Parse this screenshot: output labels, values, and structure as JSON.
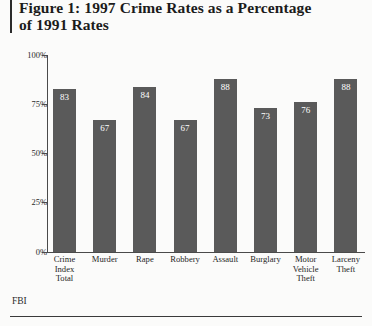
{
  "figure": {
    "title_line1": "Figure 1: 1997 Crime Rates as a Percentage",
    "title_line2": "of 1991 Rates",
    "source_note": "FBI"
  },
  "chart_data": {
    "type": "bar",
    "title": "Figure 1: 1997 Crime Rates as a Percentage of 1991 Rates",
    "xlabel": "",
    "ylabel": "",
    "ylim": [
      0,
      100
    ],
    "ytick_labels": [
      "100%",
      "75%",
      "50%",
      "25%",
      "0%"
    ],
    "ytick_values": [
      100,
      75,
      50,
      25,
      0
    ],
    "grid": false,
    "legend": false,
    "bar_color": "#5a5a5a",
    "value_label_color": "#ffffff",
    "categories": [
      "Crime Index Total",
      "Murder",
      "Rape",
      "Robbery",
      "Assault",
      "Burglary",
      "Motor Vehicle Theft",
      "Larceny Theft"
    ],
    "category_lines": [
      [
        "Crime",
        "Index",
        "Total"
      ],
      [
        "Murder"
      ],
      [
        "Rape"
      ],
      [
        "Robbery"
      ],
      [
        "Assault"
      ],
      [
        "Burglary"
      ],
      [
        "Motor",
        "Vehicle",
        "Theft"
      ],
      [
        "Larceny",
        "Theft"
      ]
    ],
    "values": [
      83,
      67,
      84,
      67,
      88,
      73,
      76,
      88
    ],
    "value_labels": [
      "83",
      "67",
      "84",
      "67",
      "88",
      "73",
      "76",
      "88"
    ]
  }
}
